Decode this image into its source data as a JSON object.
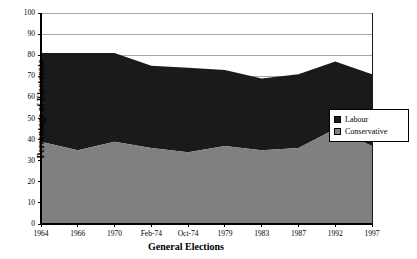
{
  "chart_data": {
    "type": "area",
    "title": "",
    "xlabel": "General Elections",
    "ylabel": "Percentage of Electorate",
    "categories": [
      "1964",
      "1966",
      "1970",
      "Feb-74",
      "Oct-74",
      "1979",
      "1983",
      "1987",
      "1992",
      "1997"
    ],
    "series": [
      {
        "name": "Conservative",
        "color": "#808080",
        "values": [
          39,
          35,
          39,
          36,
          34,
          37,
          35,
          36,
          45,
          37
        ]
      },
      {
        "name": "Labour",
        "color": "#1a1a1a",
        "values": [
          42,
          46,
          42,
          39,
          40,
          36,
          34,
          35,
          32,
          34
        ]
      }
    ],
    "stacked_totals": [
      81,
      81,
      81,
      75,
      74,
      73,
      69,
      71,
      77,
      71
    ],
    "ylim": [
      0,
      100
    ],
    "ytick_step": 10,
    "yticks": [
      "0",
      "10",
      "20",
      "30",
      "40",
      "50",
      "60",
      "70",
      "80",
      "90",
      "100"
    ],
    "grid": true,
    "legend_position": "right"
  },
  "legend": {
    "entries": [
      {
        "label": "Labour",
        "swatch": "labour-swatch"
      },
      {
        "label": "Conservative",
        "swatch": "conservative-swatch"
      }
    ]
  },
  "axes": {
    "y_title": "Percentage of Electorate",
    "x_title": "General Elections"
  },
  "colors": {
    "labour": "#1a1a1a",
    "conservative": "#808080",
    "grid": "#808080",
    "axis": "#000000",
    "background": "#ffffff"
  }
}
